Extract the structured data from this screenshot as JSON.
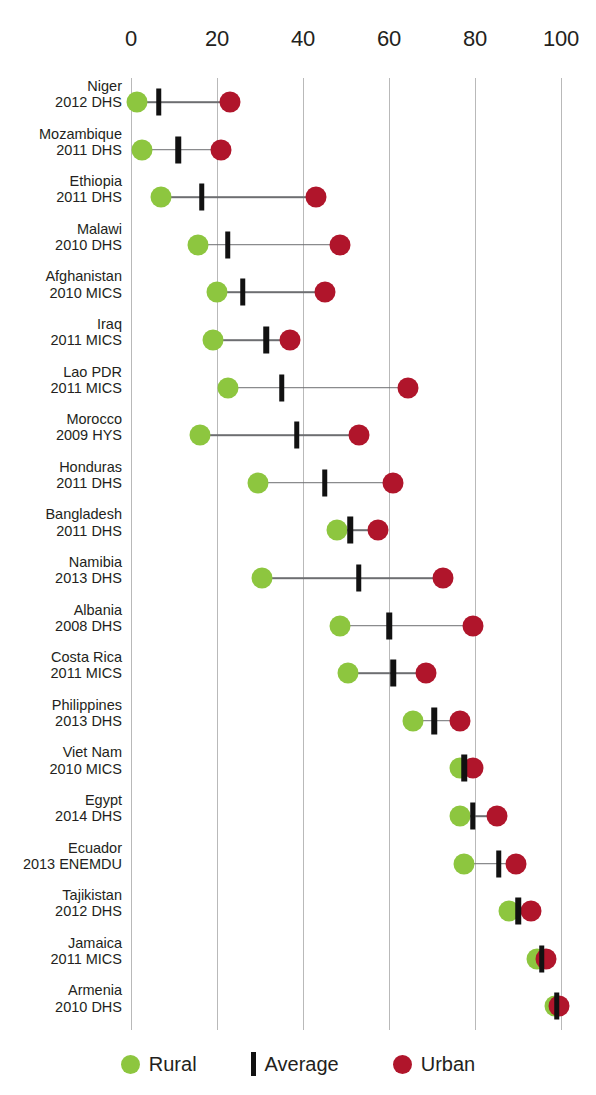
{
  "chart_data": {
    "type": "scatter",
    "title": "",
    "subtitle": "",
    "xlabel": "",
    "ylabel": "",
    "xlim": [
      0,
      105
    ],
    "xticks": [
      0,
      20,
      40,
      60,
      80,
      100
    ],
    "xticklabels": [
      "0",
      "20",
      "40",
      "60",
      "80",
      "100"
    ],
    "grid": "vertical",
    "legend_position": "bottom",
    "series": [
      {
        "name": "Rural",
        "marker": "circle",
        "color": "#8dc63f"
      },
      {
        "name": "Average",
        "marker": "bar",
        "color": "#111111"
      },
      {
        "name": "Urban",
        "marker": "circle",
        "color": "#b0152b"
      }
    ],
    "categories": [
      "Niger 2012 DHS",
      "Mozambique 2011 DHS",
      "Ethiopia 2011 DHS",
      "Malawi 2010 DHS",
      "Afghanistan 2010 MICS",
      "Iraq 2011 MICS",
      "Lao PDR 2011 MICS",
      "Morocco 2009 HYS",
      "Honduras 2011 DHS",
      "Bangladesh 2011 DHS",
      "Namibia 2013 DHS",
      "Albania 2008 DHS",
      "Costa Rica 2011 MICS",
      "Philippines 2013 DHS",
      "Viet Nam 2010 MICS",
      "Egypt 2014 DHS",
      "Ecuador 2013 ENEMDU",
      "Tajikistan 2012 DHS",
      "Jamaica 2011 MICS",
      "Armenia 2010 DHS"
    ],
    "rural": [
      1.5,
      2.5,
      7,
      15.5,
      20,
      19,
      22.5,
      16,
      29.5,
      48,
      30.5,
      48.5,
      50.5,
      65.5,
      76.5,
      76.5,
      77.5,
      88,
      94.5,
      98.5
    ],
    "average": [
      6.5,
      11,
      16.5,
      22.5,
      26,
      31.5,
      35,
      38.5,
      45,
      51,
      53,
      60,
      61,
      70.5,
      77.5,
      79.5,
      85.5,
      90,
      95.5,
      99
    ],
    "urban": [
      23,
      21,
      43,
      48.5,
      45,
      37,
      64.5,
      53,
      61,
      57.5,
      72.5,
      79.5,
      68.5,
      76.5,
      79.5,
      85,
      89.5,
      93,
      96.5,
      99.5
    ]
  },
  "axis": {
    "ticks": [
      {
        "value": 0,
        "label": "0"
      },
      {
        "value": 20,
        "label": "20"
      },
      {
        "value": 40,
        "label": "40"
      },
      {
        "value": 60,
        "label": "60"
      },
      {
        "value": 80,
        "label": "80"
      },
      {
        "value": 100,
        "label": "100"
      }
    ]
  },
  "rows": [
    {
      "country": "Niger",
      "survey": "2012 DHS",
      "rural": 1.5,
      "average": 6.5,
      "urban": 23
    },
    {
      "country": "Mozambique",
      "survey": "2011 DHS",
      "rural": 2.5,
      "average": 11,
      "urban": 21
    },
    {
      "country": "Ethiopia",
      "survey": "2011 DHS",
      "rural": 7,
      "average": 16.5,
      "urban": 43
    },
    {
      "country": "Malawi",
      "survey": "2010 DHS",
      "rural": 15.5,
      "average": 22.5,
      "urban": 48.5
    },
    {
      "country": "Afghanistan",
      "survey": "2010 MICS",
      "rural": 20,
      "average": 26,
      "urban": 45
    },
    {
      "country": "Iraq",
      "survey": "2011 MICS",
      "rural": 19,
      "average": 31.5,
      "urban": 37
    },
    {
      "country": "Lao PDR",
      "survey": "2011 MICS",
      "rural": 22.5,
      "average": 35,
      "urban": 64.5
    },
    {
      "country": "Morocco",
      "survey": "2009 HYS",
      "rural": 16,
      "average": 38.5,
      "urban": 53
    },
    {
      "country": "Honduras",
      "survey": "2011 DHS",
      "rural": 29.5,
      "average": 45,
      "urban": 61
    },
    {
      "country": "Bangladesh",
      "survey": "2011 DHS",
      "rural": 48,
      "average": 51,
      "urban": 57.5
    },
    {
      "country": "Namibia",
      "survey": "2013 DHS",
      "rural": 30.5,
      "average": 53,
      "urban": 72.5
    },
    {
      "country": "Albania",
      "survey": "2008 DHS",
      "rural": 48.5,
      "average": 60,
      "urban": 79.5
    },
    {
      "country": "Costa Rica",
      "survey": "2011 MICS",
      "rural": 50.5,
      "average": 61,
      "urban": 68.5
    },
    {
      "country": "Philippines",
      "survey": "2013 DHS",
      "rural": 65.5,
      "average": 70.5,
      "urban": 76.5
    },
    {
      "country": "Viet Nam",
      "survey": "2010 MICS",
      "rural": 76.5,
      "average": 77.5,
      "urban": 79.5
    },
    {
      "country": "Egypt",
      "survey": "2014 DHS",
      "rural": 76.5,
      "average": 79.5,
      "urban": 85
    },
    {
      "country": "Ecuador",
      "survey": "2013 ENEMDU",
      "rural": 77.5,
      "average": 85.5,
      "urban": 89.5
    },
    {
      "country": "Tajikistan",
      "survey": "2012 DHS",
      "rural": 88,
      "average": 90,
      "urban": 93
    },
    {
      "country": "Jamaica",
      "survey": "2011 MICS",
      "rural": 94.5,
      "average": 95.5,
      "urban": 96.5
    },
    {
      "country": "Armenia",
      "survey": "2010 DHS",
      "rural": 98.5,
      "average": 99,
      "urban": 99.5
    }
  ],
  "legend": {
    "items": [
      {
        "label": "Rural",
        "marker": "rural-dot",
        "color": "#8dc63f"
      },
      {
        "label": "Average",
        "marker": "average-bar",
        "color": "#111111"
      },
      {
        "label": "Urban",
        "marker": "urban-dot",
        "color": "#b0152b"
      }
    ]
  }
}
